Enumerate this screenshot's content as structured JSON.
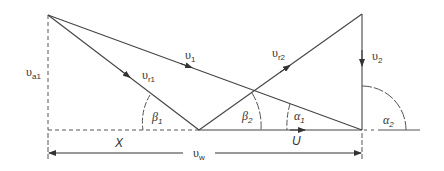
{
  "diagram": {
    "labels": {
      "va1": {
        "main": "υ",
        "sub": "a1"
      },
      "v1": {
        "main": "υ",
        "sub": "1"
      },
      "vr1": {
        "main": "υ",
        "sub": "r1"
      },
      "vr2": {
        "main": "υ",
        "sub": "r2"
      },
      "v2": {
        "main": "υ",
        "sub": "2"
      },
      "beta1": {
        "main": "β",
        "sub": "1"
      },
      "beta2": {
        "main": "β",
        "sub": "2"
      },
      "alpha1": {
        "main": "α",
        "sub": "1"
      },
      "alpha2": {
        "main": "α",
        "sub": "2"
      },
      "x": {
        "main": "X"
      },
      "u": {
        "main": "U"
      },
      "vw": {
        "main": "υ",
        "sub": "w"
      }
    },
    "colors": {
      "line": "#444444",
      "text": "#333333",
      "background": "#ffffff"
    }
  }
}
